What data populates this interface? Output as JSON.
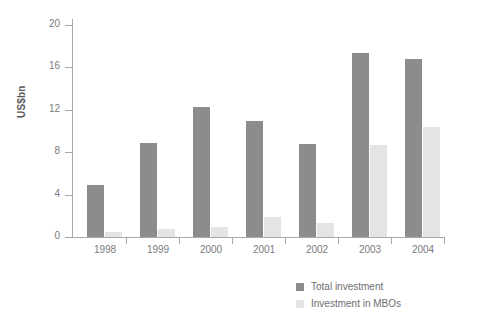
{
  "chart_data": {
    "type": "bar",
    "title": "",
    "subtitle": "",
    "xlabel": "",
    "ylabel": "US$bn",
    "ylim": [
      0,
      20
    ],
    "yticks": [
      0,
      4,
      8,
      12,
      16,
      20
    ],
    "ytick_labels": [
      "0",
      "4",
      "8",
      "12",
      "16",
      "20"
    ],
    "grid": false,
    "legend_position": "bottom-right",
    "categories": [
      "1998",
      "1999",
      "2000",
      "2001",
      "2002",
      "2003",
      "2004"
    ],
    "series": [
      {
        "name": "Total investment",
        "color": "#8c8c8c",
        "values": [
          4.9,
          8.9,
          12.3,
          10.9,
          8.8,
          17.4,
          16.8
        ]
      },
      {
        "name": "Investment in MBOs",
        "color": "#e4e4e4",
        "values": [
          0.5,
          0.8,
          0.9,
          1.9,
          1.3,
          8.7,
          10.4
        ]
      }
    ]
  },
  "axis": {
    "y_title": "US$bn"
  },
  "legend": {
    "items": [
      {
        "label": "Total investment",
        "color": "#8c8c8c"
      },
      {
        "label": "Investment in MBOs",
        "color": "#e4e4e4"
      }
    ]
  }
}
